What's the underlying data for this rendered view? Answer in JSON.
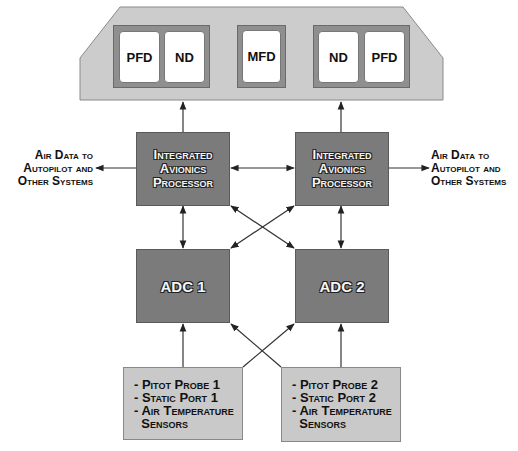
{
  "cockpit_panel": {
    "left_group": {
      "screens": [
        {
          "label": "PFD"
        },
        {
          "label": "ND"
        }
      ]
    },
    "center": {
      "label": "MFD"
    },
    "right_group": {
      "screens": [
        {
          "label": "ND"
        },
        {
          "label": "PFD"
        }
      ]
    }
  },
  "processors": [
    {
      "lines": [
        "Integrated",
        "Avionics",
        "Processor"
      ]
    },
    {
      "lines": [
        "Integrated",
        "Avionics",
        "Processor"
      ]
    }
  ],
  "outputs": {
    "left": {
      "lines": [
        "Air Data to",
        "Autopilot and",
        "Other Systems"
      ]
    },
    "right": {
      "lines": [
        "Air Data to",
        "Autopilot and",
        "Other Systems"
      ]
    }
  },
  "adcs": [
    {
      "label": "ADC 1"
    },
    {
      "label": "ADC 2"
    }
  ],
  "sensors": [
    {
      "lines": [
        "- Pitot Probe 1",
        "- Static Port 1",
        "- Air Temperature",
        "  Sensors"
      ]
    },
    {
      "lines": [
        "- Pitot Probe 2",
        "- Static Port 2",
        "- Air Temperature",
        "  Sensors"
      ]
    }
  ],
  "colors": {
    "panel": "#cccccc",
    "processor": "#7b7b7b",
    "sensor_box": "#c9c9c9",
    "wire": "#333333"
  }
}
